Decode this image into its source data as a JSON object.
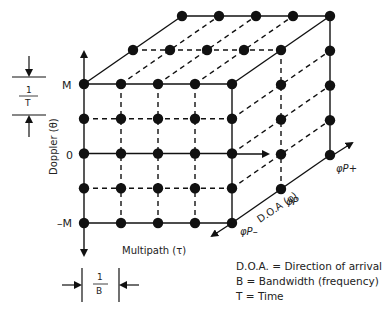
{
  "diagram": {
    "axes": {
      "doppler": {
        "label": "Doppler (θ)",
        "ticks": [
          "M",
          "0",
          "–M"
        ]
      },
      "multipath": {
        "label": "Multipath (τ)"
      },
      "doa": {
        "label": "D.O.A (φ)",
        "ticks": [
          "φP–",
          "φP",
          "φP+"
        ]
      }
    },
    "spacing": {
      "vertical": {
        "num": "1",
        "den": "T"
      },
      "horizontal": {
        "num": "1",
        "den": "B"
      }
    },
    "grid": {
      "multipath_points": 5,
      "doppler_points": 5,
      "doa_points": 3
    },
    "legend": [
      "D.O.A. = Direction of arrival",
      "B = Bandwidth (frequency)",
      "T = Time"
    ],
    "colors": {
      "ink": "#111111",
      "background": "#ffffff"
    }
  }
}
